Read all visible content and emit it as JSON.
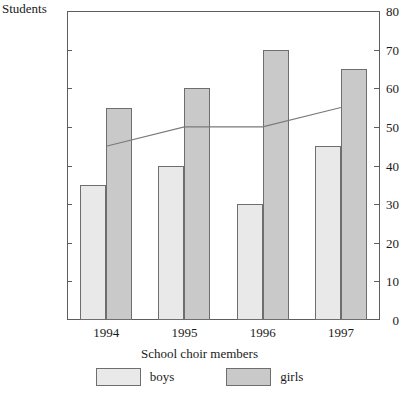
{
  "chart_data": {
    "type": "bar",
    "title": "",
    "xlabel": "School choir members",
    "ylabel": "Students",
    "categories": [
      "1994",
      "1995",
      "1996",
      "1997"
    ],
    "ylim": [
      0,
      80
    ],
    "yticks": [
      0,
      10,
      20,
      30,
      40,
      50,
      60,
      70,
      80
    ],
    "grid": false,
    "legend_position": "bottom",
    "series": [
      {
        "name": "boys",
        "type": "bar",
        "color": "#e9e9e9",
        "values": [
          35,
          40,
          30,
          45
        ]
      },
      {
        "name": "girls",
        "type": "bar",
        "color": "#c9c9c9",
        "values": [
          55,
          60,
          70,
          65
        ]
      },
      {
        "name": "average",
        "type": "line",
        "color": "#7a7a7a",
        "values": [
          45,
          50,
          50,
          55
        ]
      }
    ]
  },
  "axes": {
    "y_title": "Students",
    "x_title": "School choir members"
  },
  "legend": {
    "items": [
      {
        "label": "boys",
        "color": "#e9e9e9"
      },
      {
        "label": "girls",
        "color": "#c9c9c9"
      }
    ]
  },
  "colors": {
    "boys": "#e9e9e9",
    "girls": "#c9c9c9",
    "line": "#7a7a7a",
    "axis": "#5d5d5d",
    "bar_border": "#6e6e6e",
    "text": "#1a1a1a",
    "background": "#ffffff"
  }
}
